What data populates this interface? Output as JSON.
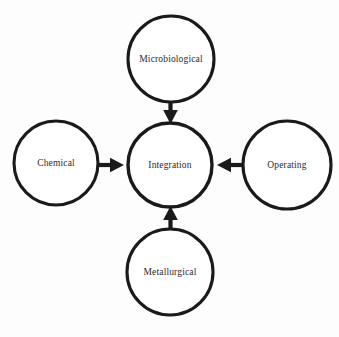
{
  "diagram": {
    "type": "hub-and-spoke",
    "background_color": "#fdfdfd",
    "stroke_color": "#1a1a1a",
    "text_color": "#2b2b2b",
    "center": {
      "id": "integration",
      "label": "Integration",
      "cx": 170,
      "cy": 165,
      "r": 42
    },
    "nodes": [
      {
        "id": "microbiological",
        "label": "Microbiological",
        "position": "top",
        "cx": 171,
        "cy": 59,
        "r": 43
      },
      {
        "id": "chemical",
        "label": "Chemical",
        "position": "left",
        "cx": 56,
        "cy": 163,
        "r": 42
      },
      {
        "id": "operating",
        "label": "Operating",
        "position": "right",
        "cx": 287,
        "cy": 165,
        "r": 44
      },
      {
        "id": "metallurgical",
        "label": "Metallurgical",
        "position": "bottom",
        "cx": 170,
        "cy": 272,
        "r": 43
      }
    ],
    "arrows": [
      {
        "id": "microbiological-to-integration",
        "from": "microbiological",
        "to": "integration",
        "direction": "down"
      },
      {
        "id": "chemical-to-integration",
        "from": "chemical",
        "to": "integration",
        "direction": "right"
      },
      {
        "id": "operating-to-integration",
        "from": "operating",
        "to": "integration",
        "direction": "left"
      },
      {
        "id": "metallurgical-to-integration",
        "from": "metallurgical",
        "to": "integration",
        "direction": "up"
      }
    ]
  }
}
